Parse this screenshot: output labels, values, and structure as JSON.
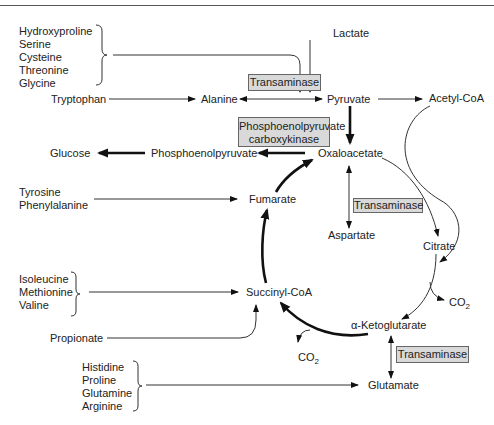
{
  "diagram": {
    "title": "",
    "groups": {
      "group1": [
        "Hydroxyproline",
        "Serine",
        "Cysteine",
        "Threonine",
        "Glycine"
      ],
      "group2": [
        "Tyrosine",
        "Phenylalanine"
      ],
      "group3": [
        "Isoleucine",
        "Methionine",
        "Valine"
      ],
      "group4": [
        "Histidine",
        "Proline",
        "Glutamine",
        "Arginine"
      ]
    },
    "nodes": {
      "lactate": "Lactate",
      "tryptophan": "Tryptophan",
      "alanine": "Alanine",
      "pyruvate": "Pyruvate",
      "acetyl_coa": "Acetyl-CoA",
      "glucose": "Glucose",
      "pep": "Phosphoenolpyruvate",
      "oxaloacetate": "Oxaloacetate",
      "fumarate": "Fumarate",
      "aspartate": "Aspartate",
      "citrate": "Citrate",
      "succinyl_coa": "Succinyl-CoA",
      "propionate": "Propionate",
      "akg": "α-Ketoglutarate",
      "glutamate": "Glutamate",
      "co2_a": "CO",
      "co2_b": "CO",
      "co2_sub": "2"
    },
    "enzymes": {
      "transaminase_1": "Transaminase",
      "pepck_line1": "Phosphoenolpyruvate",
      "pepck_line2": "carboxykinase",
      "transaminase_2": "Transaminase",
      "transaminase_3": "Transaminase"
    }
  }
}
